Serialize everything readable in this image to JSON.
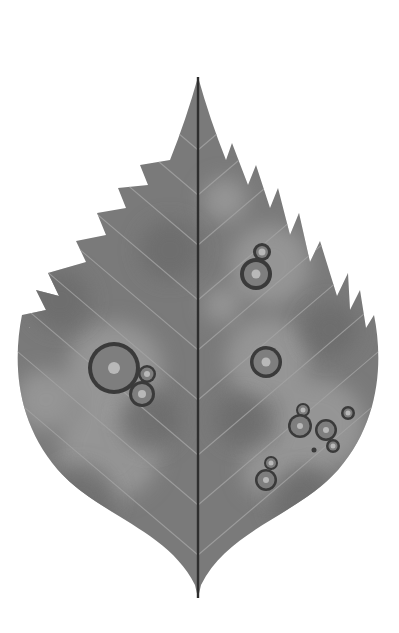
{
  "illustration": {
    "subject": "Serrated leaf with fungal leaf-spot lesions",
    "colors": {
      "background": "#ffffff",
      "leaf_fill": "#7a7a7a",
      "leaf_dark": "#6c6c6c",
      "blotch_light": "#9a9a9a",
      "midrib": "#2e2e2e",
      "vein": "#a3a3a3",
      "lesion_ring": "#3a3a3a",
      "lesion_fill": "#7e7e7e",
      "lesion_center": "#b8b8b8"
    },
    "midrib": {
      "x": 198,
      "y_top": 77,
      "y_bottom": 598
    },
    "lesions": [
      {
        "group": "left-large",
        "cx": 114,
        "cy": 368,
        "r": 26,
        "ring": 4,
        "core": 6
      },
      {
        "group": "left-large",
        "cx": 147,
        "cy": 374,
        "r": 9,
        "ring": 2.5,
        "core": 3
      },
      {
        "group": "left-large",
        "cx": 142,
        "cy": 394,
        "r": 13,
        "ring": 3,
        "core": 4
      },
      {
        "group": "right-upper",
        "cx": 262,
        "cy": 252,
        "r": 9,
        "ring": 3,
        "core": 3.5
      },
      {
        "group": "right-upper",
        "cx": 256,
        "cy": 274,
        "r": 16,
        "ring": 4,
        "core": 4.5
      },
      {
        "group": "right-middle",
        "cx": 266,
        "cy": 362,
        "r": 16,
        "ring": 3.5,
        "core": 4.5
      },
      {
        "group": "right-cluster",
        "cx": 303,
        "cy": 410,
        "r": 7,
        "ring": 2,
        "core": 2.5
      },
      {
        "group": "right-cluster",
        "cx": 300,
        "cy": 426,
        "r": 12,
        "ring": 2.5,
        "core": 3
      },
      {
        "group": "right-cluster",
        "cx": 326,
        "cy": 430,
        "r": 11,
        "ring": 2.5,
        "core": 3
      },
      {
        "group": "right-cluster",
        "cx": 333,
        "cy": 446,
        "r": 7,
        "ring": 2.5,
        "core": 2.5
      },
      {
        "group": "right-cluster",
        "cx": 348,
        "cy": 413,
        "r": 7,
        "ring": 2.5,
        "core": 2.5
      },
      {
        "group": "right-cluster",
        "cx": 314,
        "cy": 450,
        "r": 2.5,
        "ring": 1,
        "core": 0
      },
      {
        "group": "right-lower",
        "cx": 271,
        "cy": 463,
        "r": 7,
        "ring": 2,
        "core": 2.5
      },
      {
        "group": "right-lower",
        "cx": 266,
        "cy": 480,
        "r": 11,
        "ring": 2.5,
        "core": 3
      }
    ],
    "blotches": [
      {
        "cx": 225,
        "cy": 200,
        "r": 22
      },
      {
        "cx": 222,
        "cy": 305,
        "r": 18
      },
      {
        "cx": 270,
        "cy": 265,
        "r": 40
      },
      {
        "cx": 268,
        "cy": 360,
        "r": 42
      },
      {
        "cx": 115,
        "cy": 370,
        "r": 48
      },
      {
        "cx": 320,
        "cy": 425,
        "r": 45
      },
      {
        "cx": 270,
        "cy": 470,
        "r": 28
      },
      {
        "cx": 110,
        "cy": 450,
        "r": 50
      },
      {
        "cx": 45,
        "cy": 400,
        "r": 30
      }
    ]
  }
}
